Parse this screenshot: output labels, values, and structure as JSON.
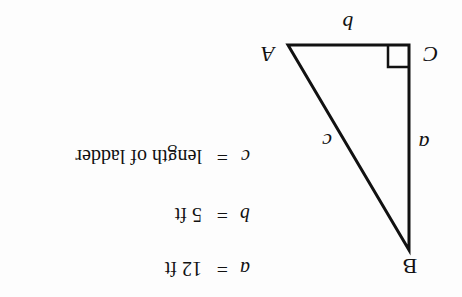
{
  "diagram": {
    "type": "right-triangle",
    "orientation": "rotated-180",
    "vertices": {
      "A": {
        "label": "A"
      },
      "B": {
        "label": "B"
      },
      "C": {
        "label": "C"
      }
    },
    "sides": {
      "a": {
        "label": "a"
      },
      "b": {
        "label": "b"
      },
      "c": {
        "label": "c"
      }
    },
    "right_angle_at": "C",
    "legend": [
      {
        "var": "a",
        "eq": "=",
        "value": "12 ft"
      },
      {
        "var": "b",
        "eq": "=",
        "value": "5 ft"
      },
      {
        "var": "c",
        "eq": "=",
        "value": "length of ladder"
      }
    ]
  }
}
